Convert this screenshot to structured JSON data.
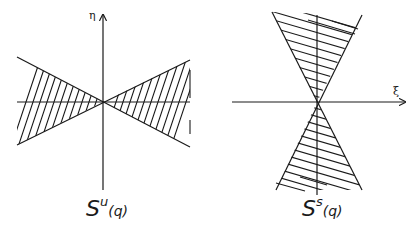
{
  "figures": [
    {
      "id": "unstable",
      "caption_base": "S",
      "caption_sup": "u",
      "caption_arg": "(q)",
      "axis_label": "η",
      "axis": "vertical"
    },
    {
      "id": "stable",
      "caption_base": "S",
      "caption_sup": "s",
      "caption_arg": "(q)",
      "axis_label": "ξ",
      "axis": "horizontal"
    }
  ],
  "colors": {
    "ink": "#1a1a1a",
    "background": "#ffffff"
  }
}
